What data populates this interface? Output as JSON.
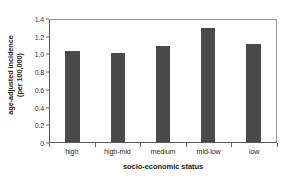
{
  "chart_data": {
    "type": "bar",
    "title": "",
    "subtitle": "",
    "categories": [
      "high",
      "high-mid",
      "medium",
      "mid-low",
      "low"
    ],
    "values": [
      1.05,
      1.02,
      1.1,
      1.31,
      1.13
    ],
    "series": [
      {
        "name": "age-adjusted incidence (per 100,000)",
        "values": [
          1.05,
          1.02,
          1.1,
          1.31,
          1.13
        ]
      }
    ],
    "xlabel": "socio-economic status",
    "ylabel_line1": "age-adjusted incidence",
    "ylabel_line2": "(per 100,000)",
    "ylabel": "age-adjusted incidence (per 100,000)",
    "ylim": [
      0,
      1.4
    ],
    "yticks": [
      0,
      0.2,
      0.4,
      0.6,
      0.8,
      1.0,
      1.2,
      1.4
    ],
    "ytick_labels": [
      "0",
      "0.2",
      "0.4",
      "0.6",
      "0.8",
      "1.0",
      "1.2",
      "1.4"
    ],
    "grid": false,
    "legend": false,
    "legend_position": "none",
    "bar_color": "#4a4a4a",
    "background_color": "#ffffff",
    "axis_color": "#5a5a5a"
  }
}
